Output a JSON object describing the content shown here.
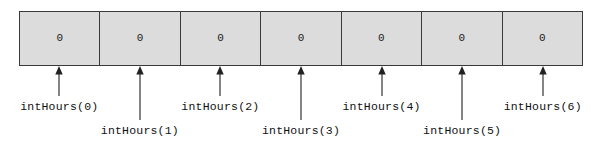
{
  "diagram": {
    "kind": "array-index-diagram",
    "colors": {
      "cell_fill": "#dcdcdc",
      "border": "#3a3a3a",
      "text": "#111111",
      "background": "#ffffff"
    },
    "array": {
      "name": "intHours",
      "cell_count": 7,
      "cells": [
        {
          "index": 0,
          "value": "0",
          "label": "intHours(0)",
          "label_row": "top"
        },
        {
          "index": 1,
          "value": "0",
          "label": "intHours(1)",
          "label_row": "bottom"
        },
        {
          "index": 2,
          "value": "0",
          "label": "intHours(2)",
          "label_row": "top"
        },
        {
          "index": 3,
          "value": "0",
          "label": "intHours(3)",
          "label_row": "bottom"
        },
        {
          "index": 4,
          "value": "0",
          "label": "intHours(4)",
          "label_row": "top"
        },
        {
          "index": 5,
          "value": "0",
          "label": "intHours(5)",
          "label_row": "bottom"
        },
        {
          "index": 6,
          "value": "0",
          "label": "intHours(6)",
          "label_row": "top"
        }
      ]
    },
    "pointer_icon": "up-arrow-icon"
  }
}
